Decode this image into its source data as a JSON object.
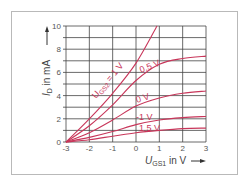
{
  "chart_data": {
    "type": "line",
    "title": "",
    "xlabel": "U_GS1 in V",
    "ylabel": "I_D in mA",
    "xlim": [
      -3,
      3
    ],
    "ylim": [
      0,
      10
    ],
    "x_ticks": [
      "-3",
      "-2",
      "-1",
      "0",
      "1",
      "2",
      "3"
    ],
    "y_ticks": [
      "0",
      "2",
      "4",
      "6",
      "8",
      "10"
    ],
    "grid": true,
    "legend": "inline curve labels",
    "series": [
      {
        "name": "U_GS2 = 1 V",
        "label": "1 V",
        "x": [
          -3,
          -2,
          -1,
          0,
          0.9
        ],
        "y": [
          0,
          2,
          4.2,
          6.8,
          10
        ]
      },
      {
        "name": "0.5 V",
        "label": "0,5 V",
        "x": [
          -3,
          -2,
          -1,
          0,
          1,
          2,
          3
        ],
        "y": [
          0,
          1.4,
          3.2,
          5.3,
          6.7,
          7.2,
          7.4
        ]
      },
      {
        "name": "0 V",
        "label": "0 V",
        "x": [
          -3,
          -2,
          -1,
          0,
          1,
          2,
          3
        ],
        "y": [
          0,
          0.8,
          1.9,
          3.1,
          3.8,
          4.2,
          4.4
        ]
      },
      {
        "name": "-1 V",
        "label": "-1 V",
        "x": [
          -3,
          -2,
          -1,
          0,
          1,
          2,
          3
        ],
        "y": [
          0,
          0.4,
          0.9,
          1.5,
          1.9,
          2.1,
          2.2
        ]
      },
      {
        "name": "-1.5 V",
        "label": "-1,5 V",
        "x": [
          -3,
          -2,
          -1,
          0,
          1,
          2,
          3
        ],
        "y": [
          0,
          0.2,
          0.5,
          0.8,
          1.0,
          1.15,
          1.2
        ]
      }
    ],
    "colors": {
      "curve": "#c8365a",
      "grid": "#444444",
      "axis_text": "#555555"
    }
  },
  "labels": {
    "y_axis_main": "I",
    "y_axis_sub": "D",
    "y_axis_rest": " in mA",
    "x_axis_main": "U",
    "x_axis_sub": "GS1",
    "x_axis_rest": " in V",
    "curve_first_prefix": "U",
    "curve_first_sub": "GS2",
    "curve_first_suffix": " = 1 V",
    "curve_labels": [
      "0,5 V",
      "0 V",
      "-1 V",
      "1,5 V"
    ]
  }
}
